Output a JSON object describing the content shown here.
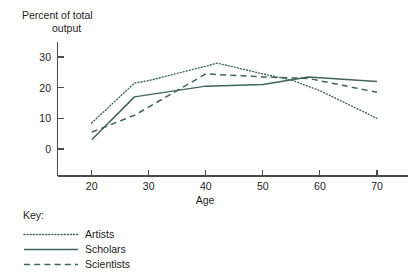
{
  "chart_data": {
    "type": "line",
    "title": "",
    "xlabel": "Age",
    "ylabel": "Percent of total output",
    "ylabel_line1": "Percent of total",
    "ylabel_line2": "output",
    "xlim": [
      17,
      74
    ],
    "ylim": [
      -3,
      33
    ],
    "xticks": [
      20,
      30,
      40,
      50,
      60,
      70
    ],
    "xtick_labels": [
      "20",
      "30",
      "40",
      "50",
      "60",
      "70"
    ],
    "yticks": [
      0,
      10,
      20,
      30
    ],
    "ytick_labels": [
      "0",
      "10",
      "20",
      "30"
    ],
    "grid": false,
    "legend_position": "below-left",
    "legend_title": "Key:",
    "line_color": "#41625d",
    "series": [
      {
        "name": "Artists",
        "style": "dotted",
        "x": [
          20,
          27.5,
          30,
          40,
          42,
          50,
          55,
          60,
          70
        ],
        "values": [
          8.5,
          21.5,
          22.3,
          27,
          28,
          24.5,
          22.5,
          19,
          10
        ]
      },
      {
        "name": "Scholars",
        "style": "solid",
        "x": [
          20,
          27.5,
          40,
          50,
          58,
          70
        ],
        "values": [
          3,
          17,
          20.5,
          21,
          23.5,
          22
        ]
      },
      {
        "name": "Scientists",
        "style": "dashed",
        "x": [
          20,
          27.5,
          40,
          50,
          58,
          70
        ],
        "values": [
          5.5,
          11,
          24.5,
          23.5,
          23,
          18.5
        ]
      }
    ]
  },
  "legend": {
    "title": "Key:",
    "entries": [
      {
        "label": "Artists",
        "style": "dotted"
      },
      {
        "label": "Scholars",
        "style": "solid"
      },
      {
        "label": "Scientists",
        "style": "dashed"
      }
    ]
  }
}
